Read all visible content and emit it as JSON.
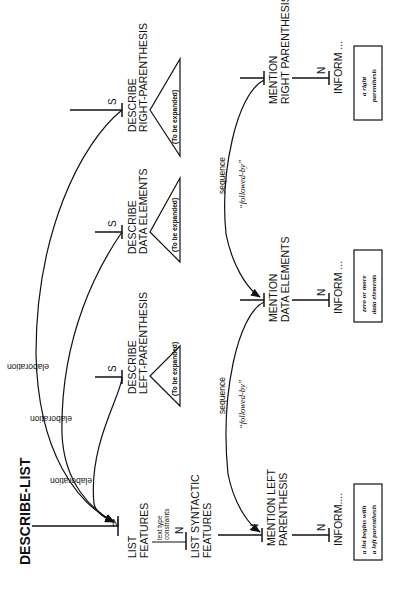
{
  "diagram": {
    "title": "DESCRIBE-LIST",
    "nodes": {
      "list_features": {
        "line1": "LIST",
        "line2": "FEATURES",
        "nucleus": "N"
      },
      "list_syntactic_features": {
        "line1": "LIST SYNTACTIC",
        "line2": "FEATURES",
        "nucleus": "N",
        "relation_line1": "text type",
        "relation_line2": "constraints"
      },
      "describe_left": {
        "line1": "DESCRIBE",
        "line2": "LEFT-PARENTHESIS",
        "satellite": "S",
        "subtree": "(To be expanded)"
      },
      "describe_data": {
        "line1": "DESCRIBE",
        "line2": "DATA ELEMENTS",
        "satellite": "S",
        "subtree": "(To be expanded)"
      },
      "describe_right": {
        "line1": "DESCRIBE",
        "line2": "RIGHT-PARENTHESIS",
        "satellite": "S",
        "subtree": "(To be expanded)"
      },
      "mention_left": {
        "line1": "MENTION LEFT",
        "line2": "PARENTHESIS",
        "nucleus": "N"
      },
      "mention_data": {
        "line1": "MENTION",
        "line2": "DATA ELEMENTS"
      },
      "mention_right": {
        "line1": "MENTION",
        "line2": "RIGHT PARENTHESIS"
      },
      "inform_left": {
        "label": "INFORM....",
        "nucleus": "N",
        "box_line1": "a list begins with",
        "box_line2": "a left parenthesis"
      },
      "inform_data": {
        "label": "INFORM ...",
        "nucleus": "N",
        "box_line1": "zero or more",
        "box_line2": "data elements"
      },
      "inform_right": {
        "label": "INFORM ...",
        "nucleus": "N",
        "box_line1": "a right",
        "box_line2": "parenthesis"
      }
    },
    "relations": {
      "elaboration_1": "elaboration",
      "elaboration_2": "elaboration",
      "elaboration_3": "elaboration",
      "sequence_1": "sequence",
      "sequence_1_gloss": "“followed-by”",
      "sequence_2": "sequence",
      "sequence_2_gloss": "“followed-by”"
    }
  }
}
